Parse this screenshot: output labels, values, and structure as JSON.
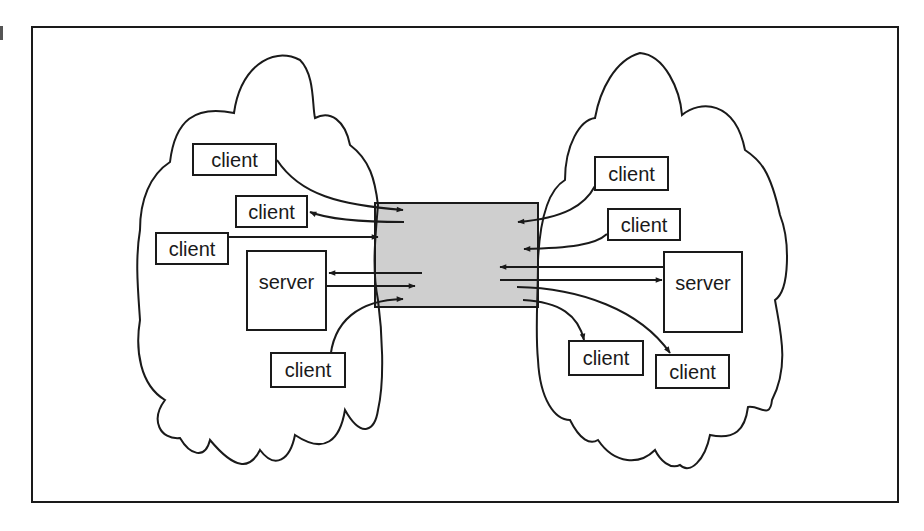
{
  "diagram": {
    "type": "network diagram",
    "colors": {
      "stroke": "#1a1a1a",
      "channel_fill": "#cfcfcf",
      "background": "#ffffff"
    },
    "left_network": {
      "nodes": [
        {
          "id": "L1",
          "label": "client",
          "x": 192,
          "y": 143,
          "w": 85,
          "h": 33
        },
        {
          "id": "L2",
          "label": "client",
          "x": 235,
          "y": 195,
          "w": 73,
          "h": 33
        },
        {
          "id": "L3",
          "label": "client",
          "x": 155,
          "y": 232,
          "w": 74,
          "h": 33
        },
        {
          "id": "L4",
          "label": "server",
          "x": 246,
          "y": 250,
          "w": 81,
          "h": 81
        },
        {
          "id": "L5",
          "label": "client",
          "x": 270,
          "y": 352,
          "w": 76,
          "h": 36
        }
      ]
    },
    "right_network": {
      "nodes": [
        {
          "id": "R1",
          "label": "client",
          "x": 594,
          "y": 156,
          "w": 75,
          "h": 35
        },
        {
          "id": "R2",
          "label": "client",
          "x": 607,
          "y": 208,
          "w": 74,
          "h": 33
        },
        {
          "id": "R3",
          "label": "server",
          "x": 663,
          "y": 251,
          "w": 80,
          "h": 82
        },
        {
          "id": "R4",
          "label": "client",
          "x": 568,
          "y": 340,
          "w": 76,
          "h": 36
        },
        {
          "id": "R5",
          "label": "client",
          "x": 655,
          "y": 354,
          "w": 75,
          "h": 35
        }
      ]
    },
    "channel": {
      "label": "",
      "x": 375,
      "y": 203,
      "w": 163,
      "h": 104
    }
  }
}
